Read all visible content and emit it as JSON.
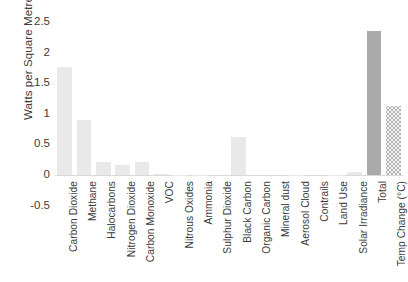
{
  "chart_data": {
    "type": "bar",
    "title": "",
    "xlabel": "",
    "ylabel": "Watts per Square Metre",
    "ylim": [
      -0.5,
      2.5
    ],
    "ytick_values": [
      2.5,
      2,
      1.5,
      1,
      0.5,
      0,
      -0.5
    ],
    "ytick_labels": [
      "2.5",
      "2",
      "1.5",
      "1",
      "0.5",
      "0",
      "-0.5"
    ],
    "grid": false,
    "legend": "none",
    "categories": [
      "Carbon Dioxide",
      "Methane",
      "Halocarbons",
      "Nitrogen Dioxide",
      "Carbon Monoxide",
      "VOC",
      "Nitrous Oxides",
      "Ammonia",
      "Sulphur Dioxide",
      "Black Carbon",
      "Organic Carbon",
      "Mineral dust",
      "Aerosol Cloud",
      "Contrails",
      "Land Use",
      "Solar Irradiance",
      "Total",
      "Temp Change (°C)"
    ],
    "values": [
      1.76,
      0.9,
      0.21,
      0.16,
      0.22,
      0.01,
      -0.01,
      -0.02,
      0.0,
      0.62,
      0.0,
      0.0,
      -0.01,
      0.0,
      -0.01,
      0.05,
      2.35,
      1.12
    ],
    "bar_styles": [
      "plain",
      "plain",
      "plain",
      "plain",
      "plain",
      "plain",
      "plain",
      "plain",
      "plain",
      "plain",
      "plain",
      "plain",
      "plain",
      "plain",
      "plain",
      "plain",
      "accent",
      "hatched"
    ],
    "colors": {
      "bar_plain": "#e9e9e9",
      "bar_accent": "#aaaaaa",
      "bar_hatched": "#b4b4b4",
      "axis_line": "#d9d9d9",
      "text": "#3b3b3b",
      "background": "#ffffff"
    }
  }
}
